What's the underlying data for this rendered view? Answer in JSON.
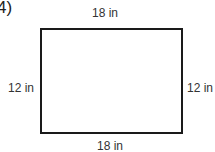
{
  "problem_number": "4)",
  "shape": "rectangle",
  "labels": {
    "top": "18 in",
    "bottom": "18 in",
    "left": "12 in",
    "right": "12 in"
  }
}
